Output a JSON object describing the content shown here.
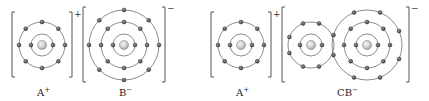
{
  "diagram": {
    "colors": {
      "ring": "#6e6e6e",
      "bracket": "#555555",
      "electron": "#4a4a4a",
      "nucleus": "#c8c8c8"
    },
    "species": [
      {
        "id": "A-plus-1",
        "label": "A",
        "superscript": "+",
        "charge": "+",
        "atoms": [
          {
            "center": [
              42,
              45
            ],
            "shells": [
              {
                "r": 11,
                "electrons": 2
              },
              {
                "r": 23,
                "electrons": 8
              }
            ]
          }
        ],
        "bracket": {
          "x1": 12,
          "x2": 72,
          "y1": 12,
          "y2": 77
        }
      },
      {
        "id": "B-minus",
        "label": "B",
        "superscript": "−",
        "charge": "−",
        "atoms": [
          {
            "center": [
              124,
              45
            ],
            "shells": [
              {
                "r": 11,
                "electrons": 2
              },
              {
                "r": 23,
                "electrons": 8
              },
              {
                "r": 35,
                "electrons": 8
              }
            ]
          }
        ],
        "bracket": {
          "x1": 83,
          "x2": 165,
          "y1": 7,
          "y2": 82
        }
      },
      {
        "id": "A-plus-2",
        "label": "A",
        "superscript": "+",
        "charge": "+",
        "atoms": [
          {
            "center": [
              241,
              45
            ],
            "shells": [
              {
                "r": 11,
                "electrons": 2
              },
              {
                "r": 23,
                "electrons": 8
              }
            ]
          }
        ],
        "bracket": {
          "x1": 211,
          "x2": 271,
          "y1": 12,
          "y2": 77
        }
      },
      {
        "id": "CB-minus",
        "label": "CB",
        "superscript": "−",
        "charge": "−",
        "atoms": [
          {
            "center": [
              311,
              45
            ],
            "shells": [
              {
                "r": 11,
                "electrons": 2
              },
              {
                "r": 23,
                "electrons": 8
              }
            ]
          },
          {
            "center": [
              367,
              45
            ],
            "shells": [
              {
                "r": 11,
                "electrons": 2
              },
              {
                "r": 23,
                "electrons": 8
              },
              {
                "r": 35,
                "electrons": 8
              }
            ]
          }
        ],
        "bracket": {
          "x1": 282,
          "x2": 409,
          "y1": 7,
          "y2": 82
        }
      }
    ],
    "labels": [
      {
        "text": "A",
        "sup": "+",
        "x": 42
      },
      {
        "text": "B",
        "sup": "−",
        "x": 124
      },
      {
        "text": "A",
        "sup": "+",
        "x": 241
      },
      {
        "text": "CB",
        "sup": "−",
        "x": 345
      }
    ]
  }
}
